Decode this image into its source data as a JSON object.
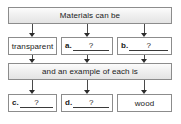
{
  "diagram": {
    "title": "Materials can be",
    "connector_title": "and an example of each is",
    "row_properties": [
      {
        "id": "transparent",
        "type": "filled",
        "text": "transparent"
      },
      {
        "id": "a",
        "type": "blank",
        "label": "a.",
        "answer": "?"
      },
      {
        "id": "b",
        "type": "blank",
        "label": "b.",
        "answer": "?"
      }
    ],
    "row_examples": [
      {
        "id": "c",
        "type": "blank",
        "label": "c.",
        "answer": "?"
      },
      {
        "id": "d",
        "type": "blank",
        "label": "d.",
        "answer": "?"
      },
      {
        "id": "wood",
        "type": "filled",
        "text": "wood"
      }
    ],
    "arrows": {
      "down_icon": "arrow-down-icon",
      "count": 9
    },
    "colors": {
      "band_fill_top": "#fcfcfc",
      "band_fill_bottom": "#e4e4e4",
      "box_border": "#8c8c8c",
      "box_fill": "#ffffff",
      "text": "#1a1a1a",
      "rule": "#3a3a3a",
      "arrow": "#2b2b2b"
    }
  }
}
